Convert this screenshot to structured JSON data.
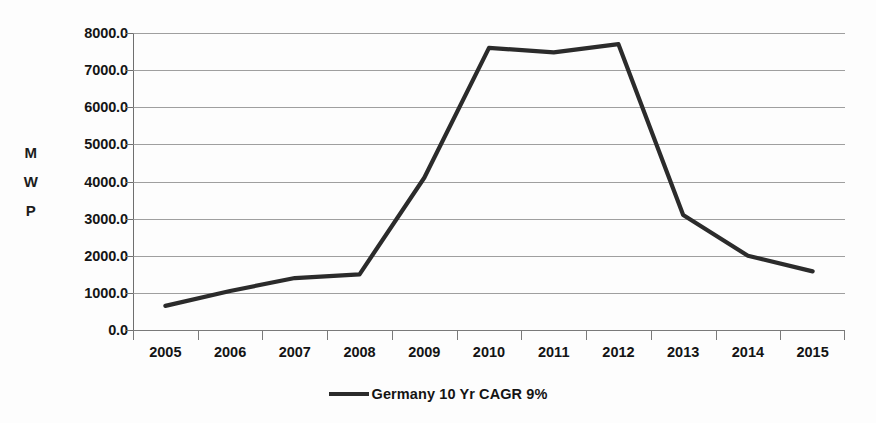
{
  "chart_data": {
    "type": "line",
    "title": "",
    "xlabel": "",
    "ylabel": "MWP",
    "ylabel_chars": [
      "M",
      "W",
      "P"
    ],
    "categories": [
      "2005",
      "2006",
      "2007",
      "2008",
      "2009",
      "2010",
      "2011",
      "2012",
      "2013",
      "2014",
      "2015"
    ],
    "ytick_labels": [
      "8000.0",
      "7000.0",
      "6000.0",
      "5000.0",
      "4000.0",
      "3000.0",
      "2000.0",
      "1000.0",
      "0.0"
    ],
    "ytick_values": [
      8000,
      7000,
      6000,
      5000,
      4000,
      3000,
      2000,
      1000,
      0
    ],
    "ylim": [
      0,
      8000
    ],
    "grid": true,
    "legend_position": "bottom",
    "series": [
      {
        "name": "Germany 10 Yr CAGR 9%",
        "color": "#2b2b2b",
        "values": [
          650,
          1050,
          1400,
          1500,
          4100,
          7600,
          7480,
          7700,
          3100,
          2000,
          1580
        ]
      }
    ]
  },
  "legend": {
    "entries": [
      {
        "label": "Germany 10 Yr CAGR 9%",
        "marker": "line-marker",
        "color": "#2b2b2b"
      }
    ]
  },
  "style": {
    "background": "#fdfdfd",
    "grid_color": "#8e8e8e",
    "axis_color": "#7a7a7a",
    "text_color": "#141414",
    "line_color": "#2b2b2b"
  }
}
